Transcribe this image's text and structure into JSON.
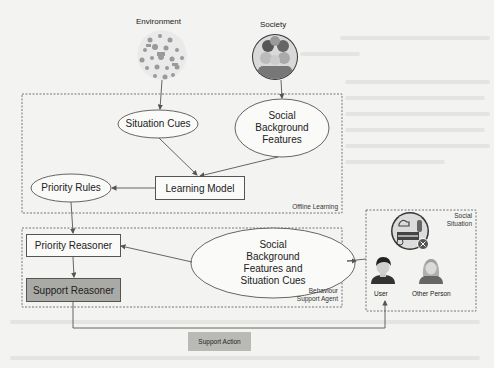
{
  "diagram": {
    "inputs": {
      "environment": {
        "label": "Environment",
        "icon": "environment-collage-icon"
      },
      "society": {
        "label": "Society",
        "icon": "group-of-people-icon"
      }
    },
    "groups": {
      "offline_learning": {
        "label": "Offline Learning"
      },
      "behaviour_support_agent": {
        "label_line1": "Behaviour",
        "label_line2": "Support Agent"
      },
      "social_situation": {
        "label_line1": "Social",
        "label_line2": "Situation"
      }
    },
    "nodes": {
      "situation_cues": {
        "label": "Situation Cues",
        "shape": "ellipse"
      },
      "social_background_features": {
        "line1": "Social",
        "line2": "Background",
        "line3": "Features",
        "shape": "ellipse"
      },
      "learning_model": {
        "label": "Learning Model",
        "shape": "rectangle"
      },
      "priority_rules": {
        "label": "Priority Rules",
        "shape": "ellipse"
      },
      "priority_reasoner": {
        "label": "Priority Reasoner",
        "shape": "rectangle"
      },
      "support_reasoner": {
        "label": "Support Reasoner",
        "shape": "rectangle",
        "fill": "#a9a9a6"
      },
      "social_features_and_cues": {
        "line1": "Social",
        "line2": "Background",
        "line3": "Features and",
        "line4": "Situation Cues",
        "shape": "ellipse"
      },
      "support_action": {
        "label": "Support Action",
        "fill": "#b9b9b6"
      }
    },
    "actors": {
      "situation_icon": "situation-scene-icon",
      "user": {
        "label": "User"
      },
      "other_person": {
        "label": "Other Person"
      }
    },
    "edges": [
      {
        "from": "Environment",
        "to": "Situation Cues"
      },
      {
        "from": "Society",
        "to": "Social Background Features"
      },
      {
        "from": "Situation Cues",
        "to": "Learning Model"
      },
      {
        "from": "Social Background Features",
        "to": "Learning Model"
      },
      {
        "from": "Learning Model",
        "to": "Priority Rules"
      },
      {
        "from": "Priority Rules",
        "to": "Priority Reasoner"
      },
      {
        "from": "Social Situation",
        "to": "Social Background Features and Situation Cues"
      },
      {
        "from": "Social Background Features and Situation Cues",
        "to": "Priority Reasoner"
      },
      {
        "from": "Priority Reasoner",
        "to": "Support Reasoner"
      },
      {
        "from": "Support Reasoner",
        "to": "User",
        "label": "Support Action"
      }
    ],
    "colors": {
      "line": "#555555",
      "shaded_box": "#a9a9a6",
      "action_box": "#b9b9b6",
      "background": "#f3f3f1"
    }
  }
}
